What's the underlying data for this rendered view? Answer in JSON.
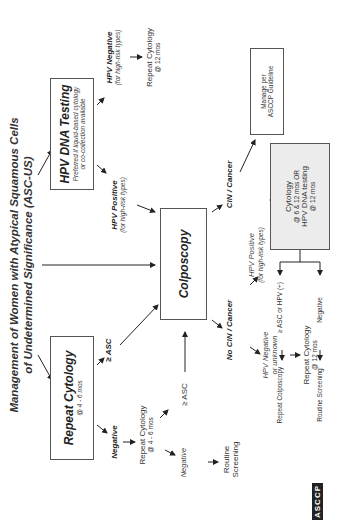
{
  "title": {
    "line1": "Management of Women with Atypical Squamous Cells",
    "line2": "of Undetermined Significance (ASC-US)"
  },
  "nodes": {
    "repeat_cytology_box": {
      "heading": "Repeat Cytology",
      "sub": "@ 4 - 6 mos"
    },
    "hpv_testing_box": {
      "heading": "HPV DNA Testing",
      "sub1": "Preferred if liquid-based cytology",
      "sub2": "or co-collection available"
    },
    "colposcopy_box": {
      "heading": "Colposcopy"
    },
    "manage_box": {
      "line1": "Manage per",
      "line2": "ASCCP Guideline"
    },
    "followup_box": {
      "line1": "Cytology",
      "line2": "@ 6 & 12 mos OR",
      "line3": "HPV DNA testing",
      "line4": "@ 12 mos"
    }
  },
  "labels": {
    "negative_1": "Negative",
    "asc_1": "≥ ASC",
    "repeat_cytology_2": {
      "line1": "Repeat Cytology",
      "line2": "@ 4 - 6 mos"
    },
    "asc_2": "≥ ASC",
    "negative_2": "Negative",
    "routine_screening_1": {
      "line1": "Routine",
      "line2": "Screening"
    },
    "hpv_positive": {
      "line1": "HPV Positive",
      "line2": "(for high-risk types)"
    },
    "hpv_negative": {
      "line1": "HPV Negative",
      "line2": "(for high-risk types)"
    },
    "repeat_cytology_12": {
      "line1": "Repeat Cytology",
      "line2": "@ 12 mos"
    },
    "cin_cancer": "CIN / Cancer",
    "no_cin_cancer": "No CIN / Cancer",
    "hpv_negative_unknown": {
      "line1": "HPV Negative",
      "line2": "or unknown"
    },
    "repeat_cytology_12b": {
      "line1": "Repeat Cytology",
      "line2": "@ 12 mos"
    },
    "hpv_positive_2": {
      "line1": "HPV Positive",
      "line2": "(for high-risk types)"
    },
    "asc_or_hpv": "≥ ASC or HPV (+)",
    "negative_3": "Negative",
    "repeat_colposcopy": "Repeat Colposcopy",
    "routine_screening_2": "Routine Screening"
  },
  "logo": {
    "text": "ASCCP"
  },
  "colors": {
    "line": "#333333",
    "box_border": "#555555",
    "gray_box": "#ececec"
  }
}
